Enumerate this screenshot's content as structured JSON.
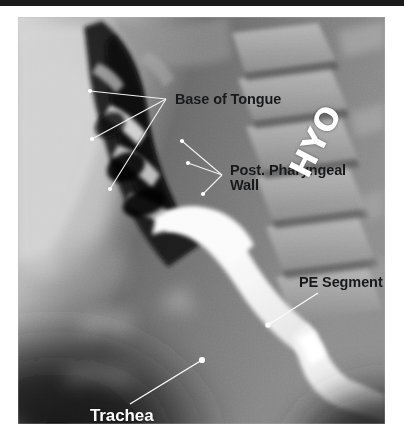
{
  "figure": {
    "kind": "lateral-videofluoroscopy-radiograph",
    "modality": "barium swallow / videofluoroscopic swallow study",
    "view": "lateral cervical",
    "film_marker": "HYO"
  },
  "annotations": [
    {
      "id": "base-of-tongue",
      "label": "Base of Tongue",
      "text_color": "#17181a",
      "leader_color": "#f2f2f2",
      "marker_color": "#ffffff",
      "apex": {
        "x": 148,
        "y": 82
      },
      "points": [
        {
          "x": 72,
          "y": 74
        },
        {
          "x": 74,
          "y": 122
        },
        {
          "x": 92,
          "y": 172
        }
      ]
    },
    {
      "id": "post-pharyngeal-wall",
      "label": "Post. Pharyngeal\nWall",
      "line1": "Post. Pharyngeal",
      "line2": "Wall",
      "text_color": "#17181a",
      "leader_color": "#f2f2f2",
      "marker_color": "#ffffff",
      "apex": {
        "x": 204,
        "y": 158
      },
      "points": [
        {
          "x": 164,
          "y": 124
        },
        {
          "x": 170,
          "y": 146
        },
        {
          "x": 185,
          "y": 177
        }
      ]
    },
    {
      "id": "pe-segment",
      "label": "PE Segment",
      "expansion": "pharyngoesophageal segment",
      "text_color": "#17181a",
      "leader_color": "#fbfbfb",
      "marker_color": "#ffffff",
      "apex": {
        "x": 300,
        "y": 276
      },
      "points": [
        {
          "x": 250,
          "y": 308
        }
      ]
    },
    {
      "id": "trachea",
      "label": "Trachea",
      "text_color": "#fdfdfd",
      "leader_color": "#fbfbfb",
      "marker_color": "#ffffff",
      "apex": {
        "x": 112,
        "y": 387
      },
      "points": [
        {
          "x": 184,
          "y": 343
        }
      ]
    }
  ],
  "palette": {
    "page_background": "#ffffff",
    "top_rule": "#1b1b1b",
    "film_soft_tissue": "#c9c9c9",
    "film_air_column": "#141414",
    "film_barium": "#fbfbfb",
    "film_bone": "#9a9a9a",
    "label_dark": "#17181a",
    "label_light": "#fdfdfd"
  }
}
